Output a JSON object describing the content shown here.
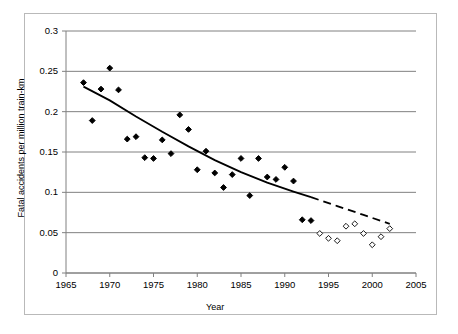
{
  "chart_data": {
    "type": "scatter",
    "title": "",
    "xlabel": "Year",
    "ylabel": "Fatal accidents per million train-km",
    "xlim": [
      1965,
      2005
    ],
    "ylim": [
      0,
      0.3
    ],
    "xticks": [
      1965,
      1970,
      1975,
      1980,
      1985,
      1990,
      1995,
      2000,
      2005
    ],
    "yticks": [
      0,
      0.05,
      0.1,
      0.15,
      0.2,
      0.25,
      0.3
    ],
    "ytick_labels": [
      "0",
      "0.05",
      "0.1",
      "0.15",
      "0.2",
      "0.25",
      "0.3"
    ],
    "xtick_labels": [
      "1965",
      "1970",
      "1975",
      "1980",
      "1985",
      "1990",
      "1995",
      "2000",
      "2005"
    ],
    "grid": "horizontal",
    "legend": "none",
    "series": [
      {
        "name": "Filled diamonds (historical)",
        "marker": "filled-diamond",
        "color": "#000000",
        "points": [
          {
            "x": 1967,
            "y": 0.236
          },
          {
            "x": 1968,
            "y": 0.189
          },
          {
            "x": 1969,
            "y": 0.228
          },
          {
            "x": 1970,
            "y": 0.254
          },
          {
            "x": 1971,
            "y": 0.227
          },
          {
            "x": 1972,
            "y": 0.166
          },
          {
            "x": 1973,
            "y": 0.169
          },
          {
            "x": 1974,
            "y": 0.143
          },
          {
            "x": 1975,
            "y": 0.142
          },
          {
            "x": 1976,
            "y": 0.165
          },
          {
            "x": 1977,
            "y": 0.148
          },
          {
            "x": 1978,
            "y": 0.196
          },
          {
            "x": 1979,
            "y": 0.178
          },
          {
            "x": 1980,
            "y": 0.128
          },
          {
            "x": 1981,
            "y": 0.151
          },
          {
            "x": 1982,
            "y": 0.124
          },
          {
            "x": 1983,
            "y": 0.106
          },
          {
            "x": 1984,
            "y": 0.122
          },
          {
            "x": 1985,
            "y": 0.142
          },
          {
            "x": 1986,
            "y": 0.096
          },
          {
            "x": 1987,
            "y": 0.142
          },
          {
            "x": 1988,
            "y": 0.119
          },
          {
            "x": 1989,
            "y": 0.116
          },
          {
            "x": 1990,
            "y": 0.131
          },
          {
            "x": 1991,
            "y": 0.114
          },
          {
            "x": 1992,
            "y": 0.066
          },
          {
            "x": 1993,
            "y": 0.065
          }
        ]
      },
      {
        "name": "Open diamonds (recent)",
        "marker": "open-diamond",
        "color": "#000000",
        "points": [
          {
            "x": 1994,
            "y": 0.049
          },
          {
            "x": 1995,
            "y": 0.043
          },
          {
            "x": 1996,
            "y": 0.04
          },
          {
            "x": 1997,
            "y": 0.058
          },
          {
            "x": 1998,
            "y": 0.061
          },
          {
            "x": 1999,
            "y": 0.049
          },
          {
            "x": 2000,
            "y": 0.035
          },
          {
            "x": 2001,
            "y": 0.045
          },
          {
            "x": 2002,
            "y": 0.055
          }
        ]
      }
    ],
    "trend_line": {
      "name": "Fitted trend (solid 1967-1993, dashed 1993-2002)",
      "color": "#000000",
      "solid_segment": [
        {
          "x": 1967,
          "y": 0.231
        },
        {
          "x": 1970,
          "y": 0.214
        },
        {
          "x": 1973,
          "y": 0.194
        },
        {
          "x": 1976,
          "y": 0.175
        },
        {
          "x": 1979,
          "y": 0.157
        },
        {
          "x": 1982,
          "y": 0.14
        },
        {
          "x": 1985,
          "y": 0.125
        },
        {
          "x": 1988,
          "y": 0.112
        },
        {
          "x": 1991,
          "y": 0.101
        },
        {
          "x": 1993,
          "y": 0.094
        }
      ],
      "dashed_segment": [
        {
          "x": 1993,
          "y": 0.094
        },
        {
          "x": 1996,
          "y": 0.083
        },
        {
          "x": 1999,
          "y": 0.072
        },
        {
          "x": 2002,
          "y": 0.061
        }
      ]
    }
  }
}
